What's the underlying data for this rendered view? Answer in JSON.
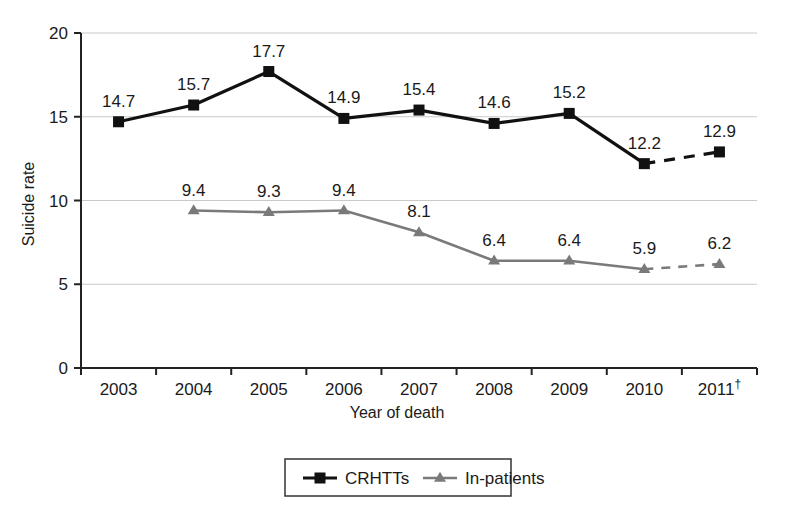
{
  "chart_data": {
    "type": "line",
    "title": "",
    "xlabel": "Year of death",
    "ylabel": "Suicide rate",
    "categories": [
      "2003",
      "2004",
      "2005",
      "2006",
      "2007",
      "2008",
      "2009",
      "2010",
      "2011"
    ],
    "x_tick_labels": [
      "2003",
      "2004",
      "2005",
      "2006",
      "2007",
      "2008",
      "2009",
      "2010",
      "2011†"
    ],
    "last_category_footnote": "†",
    "ylim": [
      0,
      20
    ],
    "y_ticks": [
      0,
      5,
      10,
      15,
      20
    ],
    "y_tick_labels": [
      "0",
      "5",
      "10",
      "15",
      "20"
    ],
    "grid": true,
    "grid_axis": "y",
    "legend_position": "bottom-center",
    "series": [
      {
        "name": "CRHTTs",
        "color": "#111111",
        "marker": "square",
        "values": [
          14.7,
          15.7,
          17.7,
          14.9,
          15.4,
          14.6,
          15.2,
          12.2,
          12.9
        ],
        "labels": [
          "14.7",
          "15.7",
          "17.7",
          "14.9",
          "15.4",
          "14.6",
          "15.2",
          "12.2",
          "12.9"
        ],
        "dashed_from_index": 7
      },
      {
        "name": "In-patients",
        "color": "#7a7a7a",
        "marker": "triangle",
        "values": [
          null,
          9.4,
          9.3,
          9.4,
          8.1,
          6.4,
          6.4,
          5.9,
          6.2
        ],
        "labels": [
          "",
          "9.4",
          "9.3",
          "9.4",
          "8.1",
          "6.4",
          "6.4",
          "5.9",
          "6.2"
        ],
        "dashed_from_index": 7
      }
    ]
  },
  "legend": {
    "items": [
      {
        "label": "CRHTTs",
        "color": "#111111",
        "marker": "square"
      },
      {
        "label": "In-patients",
        "color": "#7a7a7a",
        "marker": "triangle"
      }
    ]
  },
  "axes": {
    "y_title": "Suicide rate",
    "x_title": "Year of death"
  },
  "colors": {
    "series_primary": "#111111",
    "series_secondary": "#7a7a7a",
    "gridline": "#c9c9c9",
    "axis": "#222222",
    "background": "#ffffff"
  }
}
